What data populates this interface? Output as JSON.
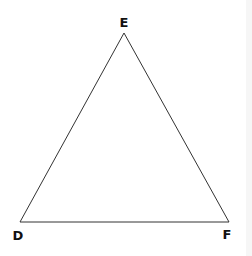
{
  "diagram": {
    "type": "triangle",
    "stroke_color": "#333333",
    "label_color": "#111111",
    "vertices": [
      {
        "id": "E",
        "label": "E",
        "x": 124,
        "y": 33,
        "label_x": 124,
        "label_y": 27
      },
      {
        "id": "D",
        "label": "D",
        "x": 20,
        "y": 222,
        "label_x": 18,
        "label_y": 240
      },
      {
        "id": "F",
        "label": "F",
        "x": 229,
        "y": 222,
        "label_x": 227,
        "label_y": 239
      }
    ],
    "edges": [
      {
        "from": "D",
        "to": "E"
      },
      {
        "from": "E",
        "to": "F"
      },
      {
        "from": "D",
        "to": "F"
      }
    ]
  }
}
